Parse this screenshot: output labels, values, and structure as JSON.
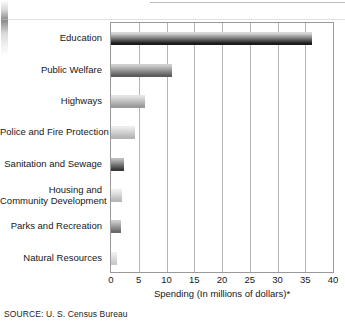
{
  "chart_data": {
    "type": "bar",
    "orientation": "horizontal",
    "title": "",
    "xlabel": "Spending (In millions of dollars)*",
    "ylabel": "",
    "xlim": [
      0,
      40
    ],
    "xticks": [
      0,
      5,
      10,
      15,
      20,
      25,
      30,
      35,
      40
    ],
    "xtick_labels": [
      "0",
      "5",
      "10",
      "15",
      "20",
      "25",
      "30",
      "35",
      "40"
    ],
    "grid": "vertical",
    "legend": "none",
    "categories": [
      "Education",
      "Public Welfare",
      "Highways",
      "Police and Fire Protection",
      "Sanitation and Sewage",
      "Housing and\nCommunity Development",
      "Parks and Recreation",
      "Natural Resources"
    ],
    "values": [
      36.3,
      11.0,
      6.1,
      4.3,
      2.3,
      2.0,
      1.8,
      1.1
    ],
    "bar_colors_top": [
      "#d8d8d8",
      "#cfcfcf",
      "#e4e4e4",
      "#ececec",
      "#bcbcbc",
      "#efefef",
      "#cccccc",
      "#f0f0f0"
    ],
    "bar_colors_bottom": [
      "#1b1b1b",
      "#5d5d5d",
      "#9a9a9a",
      "#b4b4b4",
      "#3a3a3a",
      "#b8b8b8",
      "#6a6a6a",
      "#c8c8c8"
    ]
  },
  "axis": {
    "x_title": "Spending (In millions of dollars)*",
    "ticks": [
      "0",
      "5",
      "10",
      "15",
      "20",
      "25",
      "30",
      "35",
      "40"
    ]
  },
  "categories": [
    {
      "label": "Education",
      "line1": "Education",
      "line2": ""
    },
    {
      "label": "Public Welfare",
      "line1": "Public Welfare",
      "line2": ""
    },
    {
      "label": "Highways",
      "line1": "Highways",
      "line2": ""
    },
    {
      "label": "Police and Fire Protection",
      "line1": "Police and Fire Protection",
      "line2": ""
    },
    {
      "label": "Sanitation and Sewage",
      "line1": "Sanitation and Sewage",
      "line2": ""
    },
    {
      "label": "Housing and Community Development",
      "line1": "Housing and",
      "line2": "Community Development"
    },
    {
      "label": "Parks and Recreation",
      "line1": "Parks and Recreation",
      "line2": ""
    },
    {
      "label": "Natural Resources",
      "line1": "Natural Resources",
      "line2": ""
    }
  ],
  "footer": {
    "source": "SOURCE: U. S. Census Bureau"
  }
}
